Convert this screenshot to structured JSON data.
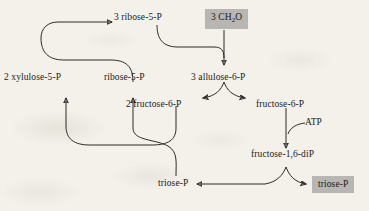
{
  "figure": {
    "title": "",
    "background_color": "#f3f1ea",
    "stroke_color": "#2b2b2b",
    "highlight_color": "#b8b6b2"
  },
  "nodes": {
    "ribose5p_top": {
      "label": "3 ribose-5-P",
      "highlighted": false
    },
    "ch2o": {
      "label_pre": "3 CH",
      "label_sub": "2",
      "label_post": "O",
      "highlighted": true
    },
    "xylulose5p": {
      "label": "2 xylulose-5-P",
      "highlighted": false
    },
    "ribose5p_mid": {
      "label": "ribose-5-P",
      "highlighted": false
    },
    "allulose6p": {
      "label": "3 allulose-6-P",
      "highlighted": false
    },
    "fructose6p_two": {
      "label": "2 fructose-6-P",
      "highlighted": false
    },
    "fructose6p": {
      "label": "fructose-6-P",
      "highlighted": false
    },
    "fructose16dip": {
      "label": "fructose-1,6-diP",
      "highlighted": false
    },
    "triosep_left": {
      "label": "triose-P",
      "highlighted": false
    },
    "triosep_right": {
      "label": "triose-P",
      "highlighted": true
    }
  },
  "cofactors": {
    "atp": {
      "label": "ATP"
    }
  },
  "edges": [
    {
      "from": "ch2o",
      "to": "allulose6p",
      "style": "straight-arrow-down"
    },
    {
      "from": "ribose5p_top",
      "to": "allulose6p",
      "style": "curve-right-down-merge"
    },
    {
      "from": "allulose6p",
      "to": "fructose6p_two",
      "style": "split-left"
    },
    {
      "from": "allulose6p",
      "to": "fructose6p",
      "style": "split-right"
    },
    {
      "from": "fructose6p",
      "to": "fructose16dip",
      "style": "straight-arrow-down"
    },
    {
      "from": "atp",
      "to": "fructose6p-arrow",
      "style": "cofactor-hook"
    },
    {
      "from": "fructose16dip",
      "to": "triosep_right",
      "style": "split-right"
    },
    {
      "from": "fructose16dip",
      "to": "triosep_left",
      "style": "split-left-long"
    },
    {
      "from": "triosep_left",
      "to": "ribose5p_mid",
      "style": "curve-up-left"
    },
    {
      "from": "fructose6p_two",
      "to": "xylulose5p",
      "style": "curve-down-left-up"
    },
    {
      "from": "ribose5p_mid",
      "to": "ribose5p_top",
      "style": "curve-up-left-top"
    }
  ]
}
